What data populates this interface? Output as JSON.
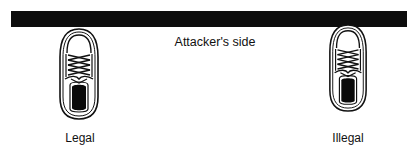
{
  "diagram": {
    "boundary_label": "Attacker's side",
    "shoes": [
      {
        "label": "Legal",
        "position": "behind line"
      },
      {
        "label": "Illegal",
        "position": "touching line"
      }
    ]
  },
  "colors": {
    "line": "#0d0d0d",
    "ink": "#111111",
    "background": "#ffffff"
  }
}
